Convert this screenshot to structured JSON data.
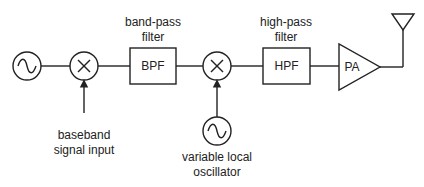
{
  "diagram": {
    "type": "block-diagram",
    "title": "",
    "blocks": [
      {
        "id": "osc1",
        "kind": "oscillator",
        "symbol": "sine-source"
      },
      {
        "id": "mix1",
        "kind": "mixer",
        "symbol": "multiply"
      },
      {
        "id": "bpf",
        "kind": "filter",
        "label": "BPF",
        "caption": [
          "band-pass",
          "filter"
        ]
      },
      {
        "id": "mix2",
        "kind": "mixer",
        "symbol": "multiply"
      },
      {
        "id": "lo",
        "kind": "oscillator",
        "symbol": "sine-source",
        "caption": [
          "variable local",
          "oscillator"
        ]
      },
      {
        "id": "hpf",
        "kind": "filter",
        "label": "HPF",
        "caption": [
          "high-pass",
          "filter"
        ]
      },
      {
        "id": "pa",
        "kind": "amplifier",
        "label": "PA"
      },
      {
        "id": "ant",
        "kind": "antenna"
      }
    ],
    "inputs": {
      "baseband": [
        "baseband",
        "signal input"
      ]
    },
    "connections": [
      [
        "osc1",
        "mix1"
      ],
      [
        "baseband",
        "mix1"
      ],
      [
        "mix1",
        "bpf"
      ],
      [
        "bpf",
        "mix2"
      ],
      [
        "lo",
        "mix2"
      ],
      [
        "mix2",
        "hpf"
      ],
      [
        "hpf",
        "pa"
      ],
      [
        "pa",
        "ant"
      ]
    ]
  },
  "labels": {
    "bpf_block": "BPF",
    "bpf_caption_1": "band-pass",
    "bpf_caption_2": "filter",
    "hpf_block": "HPF",
    "hpf_caption_1": "high-pass",
    "hpf_caption_2": "filter",
    "pa_block": "PA",
    "baseband_1": "baseband",
    "baseband_2": "signal input",
    "lo_1": "variable local",
    "lo_2": "oscillator"
  },
  "colors": {
    "stroke": "#222222",
    "background": "#ffffff"
  }
}
